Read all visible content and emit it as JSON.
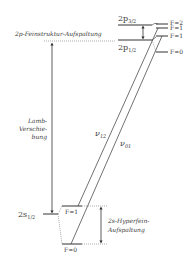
{
  "levels": {
    "p32": {
      "name": "2p",
      "sub": "3/2"
    },
    "p12": {
      "name": "2p",
      "sub": "1/2"
    },
    "s12": {
      "name": "2s",
      "sub": "1/2"
    }
  },
  "hyperfine_labels": {
    "p32_f2": "F=2",
    "p32_f1": "F=1",
    "p12_f1": "F=1",
    "p12_f0": "F=0",
    "s12_f1": "F=1",
    "s12_f0": "F=0"
  },
  "annotations": {
    "fine_structure": "2p-Feinstruktur-Aufspaltung",
    "lamb_line1": "Lamb-",
    "lamb_line2": "Verschie-",
    "lamb_line3": "bung",
    "hfs_line1": "2s-Hyperfein-",
    "hfs_line2": "Aufspaltung"
  },
  "transitions": {
    "nu12": {
      "name": "ν",
      "sub": "12"
    },
    "nu01": {
      "name": "ν",
      "sub": "01"
    }
  },
  "colors": {
    "line": "#333333",
    "dotted": "#777777"
  }
}
